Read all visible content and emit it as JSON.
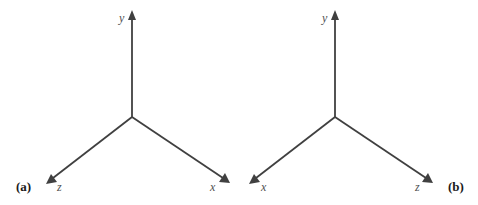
{
  "figure": {
    "panels": [
      {
        "id": "a",
        "label": "(a)",
        "origin": [
          132,
          117
        ],
        "axes": [
          {
            "name": "y",
            "label": "y",
            "tip": [
              132,
              11
            ],
            "label_pos": [
              119,
              21
            ]
          },
          {
            "name": "z",
            "label": "z",
            "tip": [
              47,
              183
            ],
            "label_pos": [
              57,
              190
            ]
          },
          {
            "name": "x",
            "label": "x",
            "tip": [
              229,
              182
            ],
            "label_pos": [
              210,
              190
            ]
          }
        ],
        "label_pos": [
          16,
          190
        ]
      },
      {
        "id": "b",
        "label": "(b)",
        "origin": [
          335,
          117
        ],
        "axes": [
          {
            "name": "y",
            "label": "y",
            "tip": [
              335,
              11
            ],
            "label_pos": [
              322,
              21
            ]
          },
          {
            "name": "x",
            "label": "x",
            "tip": [
              250,
              183
            ],
            "label_pos": [
              261,
              190
            ]
          },
          {
            "name": "z",
            "label": "z",
            "tip": [
              432,
              182
            ],
            "label_pos": [
              415,
              190
            ]
          }
        ],
        "label_pos": [
          448,
          190
        ]
      }
    ],
    "colors": {
      "axis": "#404040",
      "axis_label": "#505050",
      "panel_label": "#1a1a1a",
      "background": "#ffffff"
    }
  }
}
